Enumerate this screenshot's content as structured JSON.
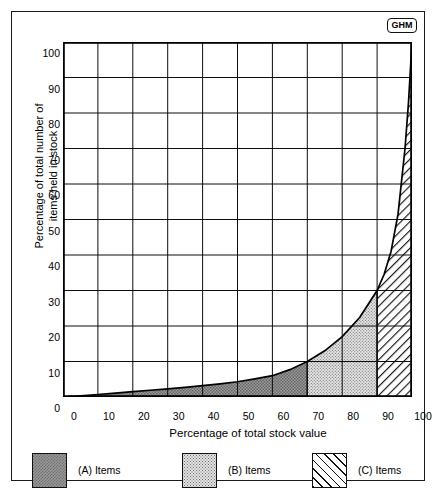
{
  "brand": {
    "badge_text": "GHM"
  },
  "chart_data": {
    "type": "area",
    "title": "",
    "xlabel": "Percentage of total stock value",
    "ylabel": "Percentage of total number of items held in stock",
    "xlim": [
      0,
      100
    ],
    "ylim": [
      0,
      100
    ],
    "grid": true,
    "legend_position": "bottom",
    "x_ticks": [
      "0",
      "10",
      "20",
      "30",
      "40",
      "50",
      "60",
      "70",
      "80",
      "90",
      "100"
    ],
    "y_ticks": [
      "0",
      "10",
      "20",
      "30",
      "40",
      "50",
      "60",
      "70",
      "80",
      "90",
      "100"
    ],
    "curve_name": "Cumulative stock distribution (Pareto / ABC curve)",
    "x": [
      0,
      5,
      10,
      15,
      20,
      25,
      30,
      35,
      40,
      45,
      50,
      55,
      60,
      65,
      70,
      75,
      80,
      85,
      90,
      92,
      94,
      96,
      98,
      99,
      100
    ],
    "y": [
      0,
      0.35,
      0.7,
      1.1,
      1.5,
      1.9,
      2.3,
      2.7,
      3.2,
      3.7,
      4.3,
      5.1,
      6.0,
      7.7,
      10.0,
      13.0,
      17.0,
      22.4,
      30.0,
      34.5,
      41.0,
      51.5,
      70.0,
      83.0,
      100.0
    ],
    "regions": [
      {
        "key": "A",
        "label": "(A) Items",
        "x_start": 0,
        "x_end": 70,
        "fill": "dark-checker",
        "color": "#9a9a9a"
      },
      {
        "key": "B",
        "label": "(B) Items",
        "x_start": 70,
        "x_end": 90,
        "fill": "light-stipple",
        "color": "#e4e4e4"
      },
      {
        "key": "C",
        "label": "(C) Items",
        "x_start": 90,
        "x_end": 100,
        "fill": "diagonal-hatch",
        "color": "#ffffff"
      }
    ],
    "annotations": [
      {
        "text": "Curve passes through approximately (70, 10)"
      },
      {
        "text": "Curve passes through approximately (90, 30)"
      },
      {
        "text": "Curve reaches (100, 100)"
      }
    ]
  },
  "legend": {
    "items": [
      {
        "label": "(A) Items"
      },
      {
        "label": "(B) Items"
      },
      {
        "label": "(C) Items"
      }
    ]
  },
  "axes": {
    "x_title": "Percentage of total stock value",
    "y_title_line1": "Percentage of total number of",
    "y_title_line2": "items held in stock"
  }
}
